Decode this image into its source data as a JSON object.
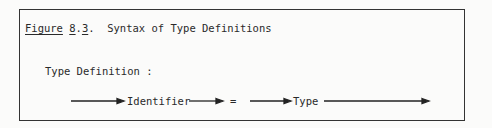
{
  "figure": {
    "caption_label": "Figure",
    "caption_number_major": "8",
    "caption_dot1": ".",
    "caption_number_minor": "3",
    "caption_dot2": ".",
    "caption_title": "  Syntax of Type Definitions"
  },
  "diagram": {
    "rule_name": "Type Definition :",
    "elements": [
      {
        "kind": "nonterminal",
        "text": "Identifier"
      },
      {
        "kind": "terminal",
        "text": "="
      },
      {
        "kind": "nonterminal",
        "text": "Type"
      }
    ],
    "arrow_icon": "right-arrow"
  }
}
